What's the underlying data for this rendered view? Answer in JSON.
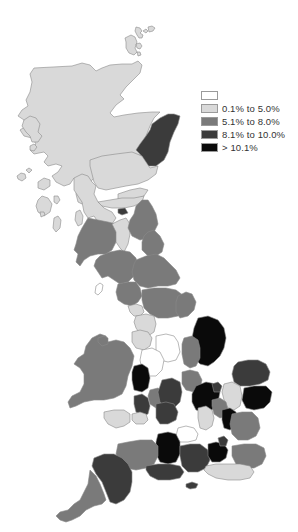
{
  "map": {
    "subject": "Great Britain regional choropleth",
    "colors": {
      "none": "#ffffff",
      "c1": "#d9d9d9",
      "c2": "#7a7a7a",
      "c3": "#3b3b3b",
      "c4": "#0a0a0a"
    }
  },
  "legend": {
    "items": [
      {
        "label": "",
        "color": "#ffffff"
      },
      {
        "label": "0.1% to 5.0%",
        "color": "#d9d9d9"
      },
      {
        "label": "5.1% to 8.0%",
        "color": "#7a7a7a"
      },
      {
        "label": "8.1% to 10.0%",
        "color": "#3b3b3b"
      },
      {
        "label": "> 10.1%",
        "color": "#0a0a0a"
      }
    ]
  }
}
